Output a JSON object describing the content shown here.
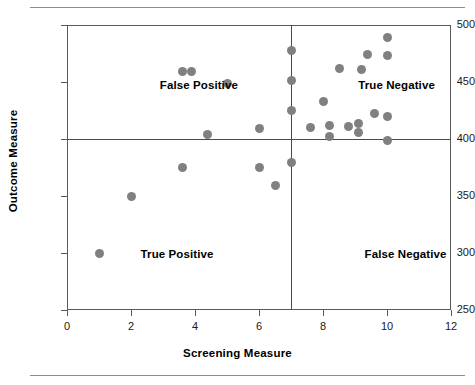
{
  "chart_data": {
    "type": "scatter",
    "title": "",
    "xlabel": "Screening Measure",
    "ylabel": "Outcome Measure",
    "xlim": [
      0,
      12
    ],
    "ylim": [
      250,
      500
    ],
    "xticks": [
      0,
      2,
      4,
      6,
      8,
      10,
      12
    ],
    "yticks": [
      250,
      300,
      350,
      400,
      450,
      500
    ],
    "xtick_labels": [
      "0",
      "2",
      "4",
      "6",
      "8",
      "10",
      "12"
    ],
    "ytick_labels": [
      "250",
      "300",
      "350",
      "400",
      "450",
      "500"
    ],
    "grid": false,
    "legend": "none",
    "marker_color": "#808080",
    "reference_lines": [
      {
        "axis": "y",
        "value": 400,
        "label": "outcome-cutoff"
      },
      {
        "axis": "x",
        "value": 7,
        "label": "screening-cutoff"
      }
    ],
    "quadrant_labels": [
      {
        "text": "False Positive",
        "x": 2.9,
        "y": 447
      },
      {
        "text": "True Negative",
        "x": 9.1,
        "y": 447
      },
      {
        "text": "True Positive",
        "x": 2.3,
        "y": 299
      },
      {
        "text": "False Negative",
        "x": 9.3,
        "y": 299
      }
    ],
    "points": [
      {
        "x": 1.0,
        "y": 300
      },
      {
        "x": 2.0,
        "y": 350
      },
      {
        "x": 3.6,
        "y": 459
      },
      {
        "x": 3.9,
        "y": 459
      },
      {
        "x": 3.6,
        "y": 375
      },
      {
        "x": 4.4,
        "y": 404
      },
      {
        "x": 5.0,
        "y": 449
      },
      {
        "x": 6.0,
        "y": 409
      },
      {
        "x": 6.0,
        "y": 375
      },
      {
        "x": 6.5,
        "y": 359
      },
      {
        "x": 7.0,
        "y": 478
      },
      {
        "x": 7.0,
        "y": 451
      },
      {
        "x": 7.0,
        "y": 425
      },
      {
        "x": 7.0,
        "y": 379
      },
      {
        "x": 7.6,
        "y": 410
      },
      {
        "x": 8.0,
        "y": 433
      },
      {
        "x": 8.2,
        "y": 412
      },
      {
        "x": 8.2,
        "y": 402
      },
      {
        "x": 8.5,
        "y": 462
      },
      {
        "x": 8.8,
        "y": 411
      },
      {
        "x": 9.1,
        "y": 414
      },
      {
        "x": 9.1,
        "y": 406
      },
      {
        "x": 9.2,
        "y": 461
      },
      {
        "x": 9.4,
        "y": 474
      },
      {
        "x": 9.6,
        "y": 422
      },
      {
        "x": 10.0,
        "y": 489
      },
      {
        "x": 10.0,
        "y": 473
      },
      {
        "x": 10.0,
        "y": 420
      },
      {
        "x": 10.0,
        "y": 399
      }
    ]
  }
}
